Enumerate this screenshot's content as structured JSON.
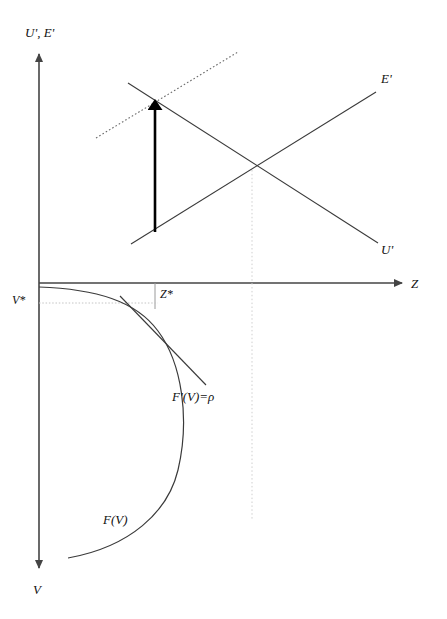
{
  "figure": {
    "type": "economics-line-diagram",
    "background_color": "#ffffff",
    "width": 447,
    "height": 619,
    "line_color": "#3a3a3a",
    "axis_color": "#444444",
    "guide_color": "#bdbdbd",
    "emphasis_color": "#000000"
  },
  "axes": {
    "origin": {
      "x": 39,
      "y": 283
    },
    "vertical_top_label": "U', E'",
    "vertical_bottom_label": "V",
    "horizontal_label": "Z",
    "vertical_axis_top_y": 48,
    "vertical_axis_bottom_y": 575,
    "horizontal_axis_right_x": 408
  },
  "labels": {
    "axis_y_top": "U', E'",
    "axis_y_bottom": "V",
    "axis_x": "Z",
    "supply_curve": "E'",
    "demand_curve": "U'",
    "z_star": "Z*",
    "v_star": "V*",
    "tangent": "F'(V)=ρ",
    "production_curve": "F(V)"
  },
  "lines": [
    {
      "name": "E-prime-line",
      "label": "E'",
      "style": "solid",
      "x1": 131,
      "y1": 244,
      "x2": 376,
      "y2": 92,
      "label_x": 381,
      "label_y": 72
    },
    {
      "name": "U-prime-line",
      "label": "U'",
      "style": "solid",
      "x1": 128,
      "y1": 83,
      "x2": 378,
      "y2": 243,
      "label_x": 381,
      "label_y": 248
    },
    {
      "name": "E-prime-shifted-dotted-line",
      "label": "",
      "style": "dotted",
      "x1": 96,
      "y1": 138,
      "x2": 238,
      "y2": 52
    },
    {
      "name": "tangent-line",
      "label": "F'(V)=ρ",
      "style": "solid",
      "x1": 120,
      "y1": 296,
      "x2": 204,
      "y2": 383,
      "label_x": 172,
      "label_y": 398
    }
  ],
  "guides": [
    {
      "name": "z-star-vertical-guide",
      "style": "dotted",
      "x1": 155,
      "y1": 283,
      "x2": 155,
      "y2": 308
    },
    {
      "name": "v-star-horizontal-guide",
      "style": "dotted",
      "x1": 39,
      "y1": 303,
      "x2": 157,
      "y2": 303
    },
    {
      "name": "equilibrium-vertical-dotted-guide",
      "style": "dotted",
      "x1": 252,
      "y1": 170,
      "x2": 252,
      "y2": 520
    }
  ],
  "arrow": {
    "name": "shift-arrow",
    "description": "bold upward arrow from E' line to new intersection",
    "x": 155,
    "y_base": 232,
    "y_tip": 97,
    "color": "#000000",
    "width": 2.6
  },
  "curve": {
    "name": "production-function-curve",
    "label": "F(V)",
    "label_x": 103,
    "label_y": 520,
    "path": "M 39,287 C 96,289 136,300 158,330 C 182,362 190,418 178,470 C 168,512 130,546 68,558",
    "tangency_point": {
      "x": 157,
      "y": 305
    }
  },
  "markers": {
    "z_star": {
      "text": "Z*",
      "x": 160,
      "y": 290
    },
    "v_star": {
      "text": "V*",
      "x": 13,
      "y": 296
    }
  }
}
